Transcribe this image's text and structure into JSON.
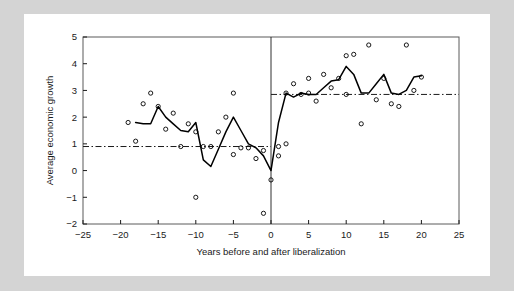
{
  "figure": {
    "background_color": "#d4d4d4",
    "paper_color": "#ffffff",
    "line_color": "#000000",
    "marker_color": "#000000"
  },
  "chart_data": {
    "type": "line",
    "title": "",
    "xlabel": "Years before and after liberalization",
    "ylabel": "Average economic growth",
    "xlim": [
      -25,
      25
    ],
    "ylim": [
      -2,
      5
    ],
    "xticks": [
      -25,
      -20,
      -15,
      -10,
      -5,
      0,
      5,
      10,
      15,
      20,
      25
    ],
    "yticks": [
      -2,
      -1,
      0,
      1,
      2,
      3,
      4,
      5
    ],
    "grid": false,
    "legend": false,
    "annotations": [
      {
        "name": "liberalization-year-line",
        "type": "vline",
        "x": 0
      },
      {
        "name": "pre-liberalization-mean-line",
        "type": "hline",
        "y": 0.9,
        "xrange": [
          -25,
          0
        ],
        "style": "dash-dot"
      },
      {
        "name": "post-liberalization-mean-line",
        "type": "hline",
        "y": 2.85,
        "xrange": [
          0,
          25
        ],
        "style": "dash-dot"
      }
    ],
    "series": [
      {
        "name": "Average economic growth (mean path)",
        "style": "solid-line",
        "x": [
          -18,
          -17,
          -16,
          -15,
          -14,
          -13,
          -12,
          -11,
          -10,
          -9,
          -8,
          -7,
          -6,
          -5,
          -4,
          -3,
          -2,
          -1,
          0,
          1,
          2,
          3,
          4,
          5,
          6,
          7,
          8,
          9,
          10,
          11,
          12,
          13,
          14,
          15,
          16,
          17,
          18,
          19,
          20
        ],
        "values": [
          1.8,
          1.75,
          1.75,
          2.4,
          2.0,
          1.75,
          1.5,
          1.45,
          1.8,
          0.4,
          0.15,
          0.8,
          1.45,
          2.0,
          1.5,
          1.0,
          0.85,
          0.55,
          0.0,
          1.8,
          2.9,
          2.75,
          2.9,
          2.85,
          2.85,
          3.1,
          3.35,
          3.4,
          3.9,
          3.6,
          2.9,
          2.9,
          3.25,
          3.6,
          2.9,
          2.85,
          3.0,
          3.5,
          3.55
        ]
      },
      {
        "name": "Country observations (scatter)",
        "style": "open-circle-markers",
        "points": [
          [
            -19,
            1.8
          ],
          [
            -18,
            1.1
          ],
          [
            -17,
            2.5
          ],
          [
            -16,
            2.9
          ],
          [
            -15,
            2.4
          ],
          [
            -14,
            1.55
          ],
          [
            -13,
            2.15
          ],
          [
            -12,
            0.9
          ],
          [
            -11,
            1.75
          ],
          [
            -10,
            1.45
          ],
          [
            -10,
            -1.0
          ],
          [
            -9,
            0.9
          ],
          [
            -8,
            0.9
          ],
          [
            -7,
            1.45
          ],
          [
            -6,
            2.0
          ],
          [
            -5,
            0.6
          ],
          [
            -5,
            2.9
          ],
          [
            -4,
            0.85
          ],
          [
            -3,
            0.85
          ],
          [
            -2,
            0.45
          ],
          [
            -1,
            0.75
          ],
          [
            -1,
            -1.6
          ],
          [
            0,
            -0.35
          ],
          [
            1,
            0.9
          ],
          [
            1,
            0.55
          ],
          [
            2,
            2.9
          ],
          [
            2,
            1.0
          ],
          [
            3,
            3.25
          ],
          [
            4,
            2.85
          ],
          [
            5,
            2.9
          ],
          [
            5,
            3.45
          ],
          [
            6,
            2.6
          ],
          [
            7,
            3.6
          ],
          [
            8,
            3.1
          ],
          [
            9,
            3.45
          ],
          [
            10,
            4.3
          ],
          [
            10,
            2.85
          ],
          [
            11,
            4.35
          ],
          [
            12,
            1.75
          ],
          [
            13,
            4.7
          ],
          [
            14,
            2.65
          ],
          [
            15,
            3.45
          ],
          [
            16,
            2.5
          ],
          [
            17,
            2.4
          ],
          [
            18,
            4.7
          ],
          [
            19,
            3.0
          ],
          [
            20,
            3.5
          ]
        ]
      }
    ]
  }
}
